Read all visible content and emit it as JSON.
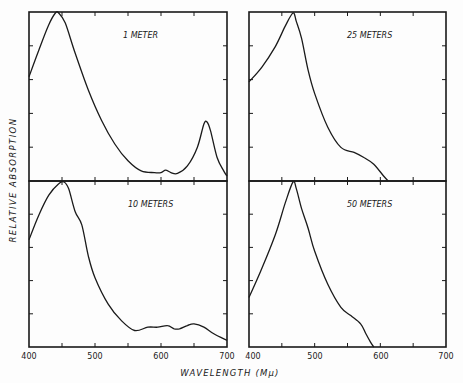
{
  "chart_data": [
    {
      "type": "line",
      "title": "1 METER",
      "xlabel": "WAVELENGTH (Mμ)",
      "ylabel": "RELATIVE ABSORPTION",
      "xlim": [
        400,
        700
      ],
      "ylim": [
        0,
        1
      ],
      "grid": false,
      "x": [
        400,
        415,
        430,
        440,
        445,
        455,
        470,
        490,
        510,
        530,
        550,
        570,
        590,
        600,
        607,
        615,
        625,
        640,
        655,
        665,
        670,
        675,
        685,
        695,
        700
      ],
      "y": [
        0.62,
        0.78,
        0.93,
        1.0,
        1.0,
        0.94,
        0.76,
        0.54,
        0.36,
        0.22,
        0.12,
        0.06,
        0.05,
        0.05,
        0.065,
        0.05,
        0.045,
        0.09,
        0.2,
        0.34,
        0.35,
        0.3,
        0.14,
        0.06,
        0.03
      ]
    },
    {
      "type": "line",
      "title": "25 METERS",
      "xlabel": "WAVELENGTH (Mμ)",
      "ylabel": "RELATIVE ABSORPTION",
      "xlim": [
        400,
        700
      ],
      "ylim": [
        0,
        1
      ],
      "grid": false,
      "x": [
        400,
        420,
        440,
        455,
        467,
        472,
        480,
        490,
        500,
        520,
        540,
        560,
        575,
        590,
        605,
        612
      ],
      "y": [
        0.59,
        0.68,
        0.8,
        0.92,
        1.0,
        0.95,
        0.85,
        0.66,
        0.52,
        0.32,
        0.2,
        0.17,
        0.14,
        0.1,
        0.03,
        0.0
      ]
    },
    {
      "type": "line",
      "title": "10 METERS",
      "xlabel": "WAVELENGTH (Mμ)",
      "ylabel": "RELATIVE ABSORPTION",
      "xlim": [
        400,
        700
      ],
      "ylim": [
        0,
        1
      ],
      "grid": false,
      "x": [
        400,
        415,
        430,
        445,
        453,
        460,
        470,
        480,
        490,
        500,
        520,
        540,
        560,
        580,
        595,
        610,
        620,
        628,
        640,
        650,
        665,
        680,
        700
      ],
      "y": [
        0.65,
        0.8,
        0.92,
        0.99,
        1.0,
        0.96,
        0.82,
        0.74,
        0.55,
        0.42,
        0.26,
        0.16,
        0.1,
        0.12,
        0.12,
        0.13,
        0.11,
        0.11,
        0.13,
        0.14,
        0.12,
        0.08,
        0.04
      ]
    },
    {
      "type": "line",
      "title": "50 METERS",
      "xlabel": "WAVELENGTH (Mμ)",
      "ylabel": "RELATIVE ABSORPTION",
      "xlim": [
        400,
        700
      ],
      "ylim": [
        0,
        1
      ],
      "grid": false,
      "x": [
        400,
        420,
        440,
        455,
        467,
        472,
        480,
        490,
        500,
        520,
        540,
        555,
        570,
        578,
        585,
        590
      ],
      "y": [
        0.3,
        0.48,
        0.68,
        0.87,
        1.0,
        0.96,
        0.84,
        0.72,
        0.58,
        0.38,
        0.24,
        0.19,
        0.14,
        0.08,
        0.03,
        0.0
      ]
    }
  ],
  "figure": {
    "ylabel": "RELATIVE ABSORPTION",
    "xlabel": "WAVELENGTH (Mμ)",
    "xticks_left": [
      "400",
      "500",
      "600",
      "700"
    ],
    "xticks_right": [
      "400",
      "500",
      "600",
      "700"
    ],
    "panel_labels": [
      "1 METER",
      "25 METERS",
      "10 METERS",
      "50 METERS"
    ],
    "line_color": "#1a1a1a",
    "background": "#fdfdfd"
  }
}
